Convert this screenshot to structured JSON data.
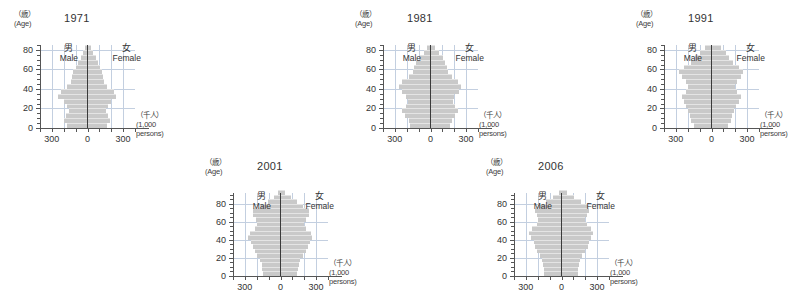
{
  "figure": {
    "axis_y_caption_jp": "（歳）",
    "axis_y_caption_en": "(Age)",
    "axis_x_caption_jp": "（千人）",
    "axis_x_caption_en_1": "(1,000",
    "axis_x_caption_en_2": "persons)",
    "male_jp": "男",
    "male_en": "Male",
    "female_jp": "女",
    "female_en": "Female",
    "bar_color": "#c9c9c9",
    "grid_color": "#c3cfe0",
    "axis_color": "#555555",
    "center_line_color": "#3b3b3b",
    "background": "#ffffff"
  },
  "chart_data": [
    {
      "type": "bar",
      "title": "1971",
      "subtitle": "",
      "xlabel": "（千人） (1,000 persons)",
      "ylabel": "（歳）(Age)",
      "orientation": "population-pyramid",
      "xlim": [
        -400,
        400
      ],
      "ylim": [
        0,
        85
      ],
      "grid": true,
      "legend_position": "inside-top",
      "x_ticks": [
        -300,
        0,
        300
      ],
      "x_tick_labels": [
        "300",
        "0",
        "300"
      ],
      "x_minor_ticks": [
        -400,
        -300,
        -200,
        -100,
        0,
        100,
        200,
        300,
        400
      ],
      "y_ticks": [
        0,
        20,
        40,
        60,
        80
      ],
      "y_tick_labels": [
        "0",
        "20",
        "40",
        "60",
        "80"
      ],
      "y_minor_step": 5,
      "age_groups": [
        0,
        5,
        10,
        15,
        20,
        25,
        30,
        35,
        40,
        45,
        50,
        55,
        60,
        65,
        70,
        75,
        80
      ],
      "series": [
        {
          "name": "Male",
          "values": [
            175,
            200,
            185,
            160,
            175,
            200,
            245,
            225,
            170,
            140,
            130,
            120,
            100,
            80,
            55,
            35,
            20
          ]
        },
        {
          "name": "Female",
          "values": [
            165,
            190,
            175,
            152,
            172,
            200,
            240,
            220,
            168,
            140,
            132,
            125,
            108,
            90,
            68,
            45,
            28
          ]
        }
      ]
    },
    {
      "type": "bar",
      "title": "1981",
      "subtitle": "",
      "xlabel": "（千人） (1,000 persons)",
      "ylabel": "（歳）(Age)",
      "orientation": "population-pyramid",
      "xlim": [
        -400,
        400
      ],
      "ylim": [
        0,
        85
      ],
      "grid": true,
      "legend_position": "inside-top",
      "x_ticks": [
        -300,
        0,
        300
      ],
      "x_tick_labels": [
        "300",
        "0",
        "300"
      ],
      "x_minor_ticks": [
        -400,
        -300,
        -200,
        -100,
        0,
        100,
        200,
        300,
        400
      ],
      "y_ticks": [
        0,
        20,
        40,
        60,
        80
      ],
      "y_tick_labels": [
        "0",
        "20",
        "40",
        "60",
        "80"
      ],
      "y_minor_step": 5,
      "age_groups": [
        0,
        5,
        10,
        15,
        20,
        25,
        30,
        35,
        40,
        45,
        50,
        55,
        60,
        65,
        70,
        75,
        80
      ],
      "series": [
        {
          "name": "Male",
          "values": [
            175,
            185,
            215,
            240,
            210,
            190,
            205,
            240,
            265,
            240,
            185,
            150,
            135,
            118,
            92,
            58,
            30
          ]
        },
        {
          "name": "Female",
          "values": [
            168,
            178,
            205,
            230,
            205,
            188,
            202,
            236,
            258,
            235,
            182,
            150,
            138,
            126,
            105,
            72,
            42
          ]
        }
      ]
    },
    {
      "type": "bar",
      "title": "1991",
      "subtitle": "",
      "xlabel": "（千人） (1,000 persons)",
      "ylabel": "（歳）(Age)",
      "orientation": "population-pyramid",
      "xlim": [
        -400,
        400
      ],
      "ylim": [
        0,
        85
      ],
      "grid": true,
      "legend_position": "inside-top",
      "x_ticks": [
        -300,
        0,
        300
      ],
      "x_tick_labels": [
        "300",
        "0",
        "300"
      ],
      "x_minor_ticks": [
        -400,
        -300,
        -200,
        -100,
        0,
        100,
        200,
        300,
        400
      ],
      "y_ticks": [
        0,
        20,
        40,
        60,
        80
      ],
      "y_tick_labels": [
        "0",
        "20",
        "40",
        "60",
        "80"
      ],
      "y_minor_step": 5,
      "age_groups": [
        0,
        5,
        10,
        15,
        20,
        25,
        30,
        35,
        40,
        45,
        50,
        55,
        60,
        65,
        70,
        75,
        80
      ],
      "series": [
        {
          "name": "Male",
          "values": [
            150,
            170,
            185,
            195,
            215,
            235,
            250,
            215,
            200,
            215,
            250,
            270,
            230,
            175,
            135,
            100,
            55
          ]
        },
        {
          "name": "Female",
          "values": [
            143,
            162,
            176,
            186,
            208,
            230,
            246,
            212,
            198,
            212,
            246,
            266,
            228,
            180,
            148,
            118,
            78
          ]
        }
      ]
    },
    {
      "type": "bar",
      "title": "2001",
      "subtitle": "",
      "xlabel": "（千人） (1,000 persons)",
      "ylabel": "（歳）(Age)",
      "orientation": "population-pyramid",
      "xlim": [
        -400,
        400
      ],
      "ylim": [
        0,
        92
      ],
      "grid": true,
      "legend_position": "inside-top",
      "x_ticks": [
        -300,
        0,
        300
      ],
      "x_tick_labels": [
        "300",
        "0",
        "300"
      ],
      "x_minor_ticks": [
        -400,
        -300,
        -200,
        -100,
        0,
        100,
        200,
        300,
        400
      ],
      "y_ticks": [
        0,
        20,
        40,
        60,
        80
      ],
      "y_tick_labels": [
        "0",
        "20",
        "40",
        "60",
        "80"
      ],
      "y_minor_step": 5,
      "age_groups": [
        0,
        5,
        10,
        15,
        20,
        25,
        30,
        35,
        40,
        45,
        50,
        55,
        60,
        65,
        70,
        75,
        80,
        85,
        90
      ],
      "series": [
        {
          "name": "Male",
          "values": [
            150,
            155,
            160,
            175,
            195,
            215,
            230,
            250,
            270,
            255,
            215,
            200,
            210,
            235,
            230,
            165,
            105,
            55,
            20
          ]
        },
        {
          "name": "Female",
          "values": [
            143,
            148,
            153,
            168,
            190,
            212,
            228,
            248,
            268,
            253,
            214,
            200,
            212,
            240,
            242,
            188,
            140,
            88,
            38
          ]
        }
      ]
    },
    {
      "type": "bar",
      "title": "2006",
      "subtitle": "",
      "xlabel": "（千人） (1,000 persons)",
      "ylabel": "（歳）(Age)",
      "orientation": "population-pyramid",
      "xlim": [
        -400,
        400
      ],
      "ylim": [
        0,
        92
      ],
      "grid": true,
      "legend_position": "inside-top",
      "x_ticks": [
        -300,
        0,
        300
      ],
      "x_tick_labels": [
        "300",
        "0",
        "300"
      ],
      "x_minor_ticks": [
        -400,
        -300,
        -200,
        -100,
        0,
        100,
        200,
        300,
        400
      ],
      "y_ticks": [
        0,
        20,
        40,
        60,
        80
      ],
      "y_tick_labels": [
        "0",
        "20",
        "40",
        "60",
        "80"
      ],
      "y_minor_step": 5,
      "age_groups": [
        0,
        5,
        10,
        15,
        20,
        25,
        30,
        35,
        40,
        45,
        50,
        55,
        60,
        65,
        70,
        75,
        80,
        85,
        90
      ],
      "series": [
        {
          "name": "Male",
          "values": [
            145,
            150,
            158,
            163,
            180,
            205,
            225,
            235,
            255,
            270,
            250,
            210,
            196,
            205,
            220,
            200,
            130,
            70,
            25
          ]
        },
        {
          "name": "Female",
          "values": [
            138,
            143,
            150,
            156,
            174,
            200,
            222,
            233,
            252,
            268,
            250,
            212,
            200,
            212,
            234,
            226,
            166,
            105,
            48
          ]
        }
      ]
    }
  ],
  "panels": [
    {
      "index": 0,
      "title": "1971"
    },
    {
      "index": 1,
      "title": "1981"
    },
    {
      "index": 2,
      "title": "1991"
    },
    {
      "index": 3,
      "title": "2001"
    },
    {
      "index": 4,
      "title": "2006"
    }
  ]
}
